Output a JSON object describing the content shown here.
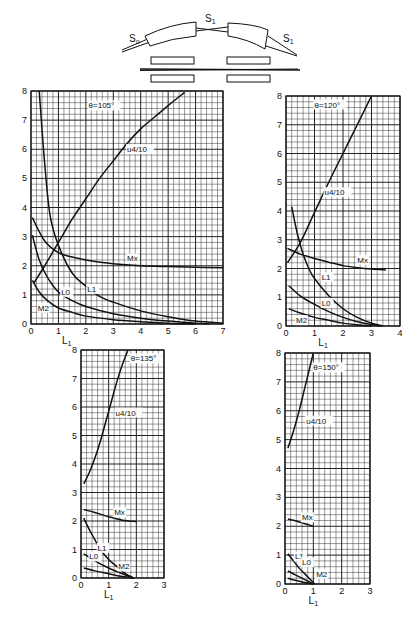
{
  "schematic": {
    "labels": {
      "s0": "S",
      "s0_sub": "o",
      "s1_mid": "S",
      "s1_mid_sub": "1",
      "s1_right": "S",
      "s1_right_sub": "1"
    }
  },
  "chart_data": [
    {
      "type": "line",
      "title": "θ=105°",
      "xlabel": "L1",
      "ylabel": "",
      "xlim": [
        0,
        7
      ],
      "ylim": [
        0,
        8
      ],
      "xticks": [
        "0",
        "1",
        "2",
        "3",
        "4",
        "5",
        "6",
        "7"
      ],
      "yticks": [
        "0",
        "1",
        "2",
        "3",
        "4",
        "5",
        "6",
        "7",
        "8"
      ],
      "grid": true,
      "series": [
        {
          "name": "u4/10",
          "x": [
            0.1,
            0.5,
            1.0,
            1.5,
            2.0,
            2.5,
            3.0,
            3.5,
            4.0,
            4.5,
            5.0,
            5.6
          ],
          "y": [
            1.4,
            2.0,
            2.8,
            3.6,
            4.3,
            5.0,
            5.6,
            6.2,
            6.7,
            7.1,
            7.5,
            7.95
          ]
        },
        {
          "name": "Mx",
          "x": [
            0.05,
            0.5,
            1.0,
            1.5,
            2.0,
            3.0,
            4.0,
            5.0,
            6.0,
            7.0
          ],
          "y": [
            3.65,
            2.85,
            2.45,
            2.3,
            2.2,
            2.07,
            2.0,
            1.97,
            1.95,
            1.93
          ]
        },
        {
          "name": "L1",
          "x": [
            0.3,
            0.5,
            0.7,
            1.0,
            1.5,
            2.0,
            2.5,
            3.0,
            4.0,
            5.0,
            6.0,
            7.0
          ],
          "y": [
            8.0,
            5.5,
            3.7,
            2.7,
            1.75,
            1.3,
            0.95,
            0.75,
            0.45,
            0.25,
            0.1,
            0.03
          ]
        },
        {
          "name": "L0",
          "x": [
            0.05,
            0.3,
            0.6,
            1.0,
            1.5,
            2.0,
            3.0,
            4.0,
            5.0,
            6.0,
            6.5
          ],
          "y": [
            3.05,
            2.2,
            1.6,
            1.1,
            0.8,
            0.6,
            0.35,
            0.2,
            0.1,
            0.03,
            0.0
          ]
        },
        {
          "name": "M2",
          "x": [
            0.05,
            0.3,
            0.6,
            1.0,
            1.5,
            2.0,
            3.0,
            4.0,
            5.0,
            6.0
          ],
          "y": [
            1.5,
            1.1,
            0.8,
            0.55,
            0.4,
            0.27,
            0.15,
            0.08,
            0.03,
            0.0
          ]
        }
      ],
      "annotations": [
        {
          "text": "θ=105°",
          "x": 2.1,
          "y": 7.4
        },
        {
          "text": "u4/10",
          "x": 3.5,
          "y": 5.9
        },
        {
          "text": "Mx",
          "x": 3.5,
          "y": 2.15
        },
        {
          "text": "L1",
          "x": 2.05,
          "y": 1.1
        },
        {
          "text": "L0",
          "x": 1.1,
          "y": 1.0
        },
        {
          "text": "M2",
          "x": 0.25,
          "y": 0.45
        }
      ]
    },
    {
      "type": "line",
      "title": "θ=120°",
      "xlabel": "L1",
      "ylabel": "",
      "xlim": [
        0,
        4
      ],
      "ylim": [
        0,
        8
      ],
      "xticks": [
        "0",
        "1",
        "2",
        "3",
        "4"
      ],
      "yticks": [
        "0",
        "1",
        "2",
        "3",
        "4",
        "5",
        "6",
        "7",
        "8"
      ],
      "grid": true,
      "series": [
        {
          "name": "u4/10",
          "x": [
            0.05,
            0.5,
            1.0,
            1.5,
            2.0,
            2.5,
            3.0
          ],
          "y": [
            2.2,
            2.9,
            3.95,
            5.0,
            6.0,
            7.0,
            8.0
          ]
        },
        {
          "name": "Mx",
          "x": [
            0.05,
            0.5,
            1.0,
            1.5,
            2.0,
            2.5,
            3.0,
            3.5
          ],
          "y": [
            2.7,
            2.5,
            2.35,
            2.22,
            2.1,
            2.03,
            1.98,
            1.95
          ]
        },
        {
          "name": "L1",
          "x": [
            0.2,
            0.4,
            0.6,
            0.8,
            1.0,
            1.5,
            2.0,
            2.5,
            3.0,
            3.4
          ],
          "y": [
            4.15,
            3.2,
            2.5,
            2.0,
            1.65,
            1.05,
            0.6,
            0.3,
            0.1,
            0.0
          ]
        },
        {
          "name": "L0",
          "x": [
            0.1,
            0.5,
            1.0,
            1.5,
            2.0,
            2.5,
            3.0,
            3.3
          ],
          "y": [
            1.4,
            1.05,
            0.75,
            0.5,
            0.3,
            0.15,
            0.05,
            0.0
          ]
        },
        {
          "name": "M2",
          "x": [
            0.1,
            0.5,
            1.0,
            1.5,
            2.0,
            2.5,
            3.0
          ],
          "y": [
            0.6,
            0.45,
            0.3,
            0.2,
            0.1,
            0.04,
            0.0
          ]
        }
      ],
      "annotations": [
        {
          "text": "θ=120°",
          "x": 1.0,
          "y": 7.6
        },
        {
          "text": "u4/10",
          "x": 1.35,
          "y": 4.55
        },
        {
          "text": "Mx",
          "x": 2.5,
          "y": 2.2
        },
        {
          "text": "L1",
          "x": 1.25,
          "y": 1.6
        },
        {
          "text": "L0",
          "x": 1.25,
          "y": 0.7
        },
        {
          "text": "M2",
          "x": 0.35,
          "y": 0.1
        }
      ]
    },
    {
      "type": "line",
      "title": "θ=135°",
      "xlabel": "L1",
      "ylabel": "",
      "xlim": [
        0,
        3
      ],
      "ylim": [
        0,
        8
      ],
      "xticks": [
        "0",
        "1",
        "2",
        "3"
      ],
      "yticks": [
        "0",
        "1",
        "2",
        "3",
        "4",
        "5",
        "6",
        "7",
        "8"
      ],
      "grid": true,
      "series": [
        {
          "name": "u4/10",
          "x": [
            0.1,
            0.3,
            0.5,
            0.7,
            0.9,
            1.1,
            1.3,
            1.5,
            1.7
          ],
          "y": [
            3.3,
            3.7,
            4.2,
            4.8,
            5.5,
            6.2,
            6.9,
            7.5,
            8.0
          ]
        },
        {
          "name": "Mx",
          "x": [
            0.1,
            0.5,
            1.0,
            1.5,
            2.0
          ],
          "y": [
            2.4,
            2.3,
            2.15,
            2.03,
            1.98
          ]
        },
        {
          "name": "L1",
          "x": [
            0.1,
            0.3,
            0.5,
            0.7,
            1.0,
            1.3,
            1.6,
            1.9
          ],
          "y": [
            2.1,
            1.7,
            1.35,
            1.0,
            0.65,
            0.4,
            0.15,
            0.0
          ]
        },
        {
          "name": "L0",
          "x": [
            0.1,
            0.5,
            1.0,
            1.5,
            1.9
          ],
          "y": [
            0.85,
            0.6,
            0.35,
            0.15,
            0.0
          ]
        },
        {
          "name": "M2",
          "x": [
            0.1,
            0.5,
            1.0,
            1.5,
            1.9
          ],
          "y": [
            0.35,
            0.25,
            0.15,
            0.05,
            0.0
          ]
        }
      ],
      "annotations": [
        {
          "text": "θ=135°",
          "x": 1.8,
          "y": 7.6
        },
        {
          "text": "u4/10",
          "x": 1.25,
          "y": 5.7
        },
        {
          "text": "Mx",
          "x": 1.2,
          "y": 2.2
        },
        {
          "text": "L1",
          "x": 0.6,
          "y": 0.95
        },
        {
          "text": "L0",
          "x": 0.3,
          "y": 0.65
        },
        {
          "text": "M2",
          "x": 1.35,
          "y": 0.3
        }
      ]
    },
    {
      "type": "line",
      "title": "θ=150°",
      "xlabel": "L1",
      "ylabel": "",
      "xlim": [
        0,
        3
      ],
      "ylim": [
        0,
        8
      ],
      "xticks": [
        "0",
        "1",
        "2",
        "3"
      ],
      "yticks": [
        "0",
        "1",
        "2",
        "3",
        "4",
        "5",
        "6",
        "7",
        "8"
      ],
      "grid": true,
      "series": [
        {
          "name": "u4/10",
          "x": [
            0.1,
            0.3,
            0.5,
            0.7,
            0.9,
            1.0
          ],
          "y": [
            4.7,
            5.3,
            6.0,
            6.8,
            7.6,
            8.0
          ]
        },
        {
          "name": "Mx",
          "x": [
            0.1,
            0.5,
            1.0
          ],
          "y": [
            2.25,
            2.15,
            2.0
          ]
        },
        {
          "name": "L1",
          "x": [
            0.1,
            0.3,
            0.5,
            0.7,
            0.9,
            1.05
          ],
          "y": [
            1.05,
            0.8,
            0.55,
            0.35,
            0.15,
            0.0
          ]
        },
        {
          "name": "L0",
          "x": [
            0.1,
            0.4,
            0.7,
            1.0
          ],
          "y": [
            0.45,
            0.3,
            0.15,
            0.0
          ]
        },
        {
          "name": "M2",
          "x": [
            0.1,
            0.4,
            0.7,
            1.0
          ],
          "y": [
            0.2,
            0.12,
            0.05,
            0.0
          ]
        }
      ],
      "annotations": [
        {
          "text": "θ=150°",
          "x": 1.0,
          "y": 7.4
        },
        {
          "text": "u4/10",
          "x": 0.75,
          "y": 5.55
        },
        {
          "text": "Mx",
          "x": 0.6,
          "y": 2.2
        },
        {
          "text": "L1",
          "x": 0.35,
          "y": 0.85
        },
        {
          "text": "L0",
          "x": 0.6,
          "y": 0.65
        },
        {
          "text": "M2",
          "x": 1.1,
          "y": 0.25
        }
      ]
    }
  ]
}
